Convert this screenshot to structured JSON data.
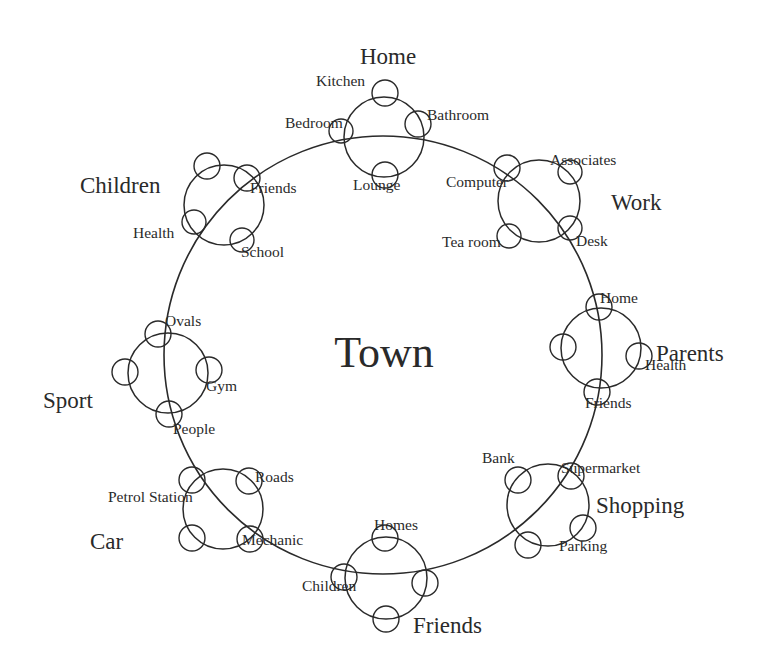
{
  "diagram": {
    "type": "concentric-cluster",
    "center_label": "Town",
    "center_label_pos": [
      384,
      367
    ],
    "ring": {
      "cx": 383,
      "cy": 355,
      "r": 219
    },
    "groups": [
      {
        "name": "Home",
        "label_pos": [
          388,
          64
        ],
        "circle": [
          384,
          137,
          40
        ],
        "items": [
          {
            "label": "Kitchen",
            "circle": [
              385,
              93,
              13
            ],
            "label_pos": [
              316,
              86
            ]
          },
          {
            "label": "Bathroom",
            "circle": [
              418,
              124,
              13
            ],
            "label_pos": [
              427,
              120
            ]
          },
          {
            "label": "Bedroom",
            "circle": [
              341,
              131,
              12
            ],
            "label_pos": [
              285,
              128
            ]
          },
          {
            "label": "Lounge",
            "circle": [
              385,
              175,
              13
            ],
            "label_pos": [
              353,
              190
            ]
          }
        ]
      },
      {
        "name": "Work",
        "label_pos": [
          611,
          210
        ],
        "circle": [
          539,
          201,
          41
        ],
        "items": [
          {
            "label": "Computer",
            "circle": [
              507,
              168,
              13
            ],
            "label_pos": [
              446,
              187
            ]
          },
          {
            "label": "Associates",
            "circle": [
              570,
              172,
              12
            ],
            "label_pos": [
              550,
              165
            ]
          },
          {
            "label": "Tea room",
            "circle": [
              509,
              236,
              12
            ],
            "label_pos": [
              442,
              247
            ]
          },
          {
            "label": "Desk",
            "circle": [
              570,
              228,
              12
            ],
            "label_pos": [
              576,
              246
            ]
          }
        ]
      },
      {
        "name": "Parents",
        "label_pos": [
          656,
          361
        ],
        "circle": [
          601,
          348,
          40
        ],
        "items": [
          {
            "label": "Home",
            "circle": [
              599,
              307,
              13
            ],
            "label_pos": [
              600,
              303
            ]
          },
          {
            "label": "",
            "circle": [
              563,
              347,
              13
            ],
            "label_pos": [
              0,
              0
            ]
          },
          {
            "label": "Health",
            "circle": [
              639,
              356,
              13
            ],
            "label_pos": [
              645,
              370
            ]
          },
          {
            "label": "Friends",
            "circle": [
              597,
              392,
              13
            ],
            "label_pos": [
              585,
              408
            ]
          }
        ]
      },
      {
        "name": "Shopping",
        "label_pos": [
          596,
          513
        ],
        "circle": [
          548,
          505,
          41
        ],
        "items": [
          {
            "label": "Bank",
            "circle": [
              518,
              480,
              13
            ],
            "label_pos": [
              482,
              463
            ]
          },
          {
            "label": "Supermarket",
            "circle": [
              571,
              476,
              13
            ],
            "label_pos": [
              561,
              473
            ]
          },
          {
            "label": "Parking",
            "circle": [
              583,
              528,
              13
            ],
            "label_pos": [
              559,
              551
            ]
          },
          {
            "label": "",
            "circle": [
              528,
              545,
              13
            ],
            "label_pos": [
              0,
              0
            ]
          }
        ]
      },
      {
        "name": "Friends",
        "label_pos": [
          413,
          633
        ],
        "circle": [
          386,
          578,
          41
        ],
        "items": [
          {
            "label": "Homes",
            "circle": [
              385,
              538,
              13
            ],
            "label_pos": [
              374,
              530
            ]
          },
          {
            "label": "Children",
            "circle": [
              344,
              577,
              13
            ],
            "label_pos": [
              302,
              591
            ]
          },
          {
            "label": "",
            "circle": [
              425,
              583,
              13
            ],
            "label_pos": [
              0,
              0
            ]
          },
          {
            "label": "",
            "circle": [
              386,
              619,
              13
            ],
            "label_pos": [
              0,
              0
            ]
          }
        ]
      },
      {
        "name": "Car",
        "label_pos": [
          90,
          549
        ],
        "circle": [
          223,
          509,
          40
        ],
        "items": [
          {
            "label": "Petrol Station",
            "circle": [
              192,
              480,
              13
            ],
            "label_pos": [
              108,
              502
            ]
          },
          {
            "label": "Roads",
            "circle": [
              249,
              481,
              13
            ],
            "label_pos": [
              255,
              482
            ]
          },
          {
            "label": "",
            "circle": [
              192,
              538,
              13
            ],
            "label_pos": [
              0,
              0
            ]
          },
          {
            "label": "Mechanic",
            "circle": [
              250,
              539,
              13
            ],
            "label_pos": [
              242,
              545
            ]
          }
        ]
      },
      {
        "name": "Sport",
        "label_pos": [
          43,
          408
        ],
        "circle": [
          168,
          373,
          40
        ],
        "items": [
          {
            "label": "Ovals",
            "circle": [
              158,
              334,
              13
            ],
            "label_pos": [
              165,
              326
            ]
          },
          {
            "label": "",
            "circle": [
              125,
              372,
              13
            ],
            "label_pos": [
              0,
              0
            ]
          },
          {
            "label": "Gym",
            "circle": [
              209,
              370,
              13
            ],
            "label_pos": [
              206,
              391
            ]
          },
          {
            "label": "People",
            "circle": [
              169,
              414,
              13
            ],
            "label_pos": [
              173,
              434
            ]
          }
        ]
      },
      {
        "name": "Children",
        "label_pos": [
          80,
          193
        ],
        "circle": [
          224,
          205,
          40
        ],
        "items": [
          {
            "label": "",
            "circle": [
              207,
              166,
              13
            ],
            "label_pos": [
              0,
              0
            ]
          },
          {
            "label": "Friends",
            "circle": [
              247,
              178,
              13
            ],
            "label_pos": [
              250,
              193
            ]
          },
          {
            "label": "Health",
            "circle": [
              194,
              222,
              12
            ],
            "label_pos": [
              133,
              238
            ]
          },
          {
            "label": "School",
            "circle": [
              242,
              240,
              12
            ],
            "label_pos": [
              241,
              257
            ]
          }
        ]
      }
    ]
  }
}
